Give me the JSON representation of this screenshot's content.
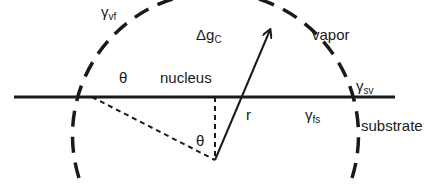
{
  "diagram": {
    "colors": {
      "stroke": "#1a1a1a",
      "background": "#ffffff"
    },
    "regions": {
      "vapor": "vapor",
      "nucleus": "nucleus",
      "substrate": "substrate"
    },
    "labels": {
      "gamma_vf": {
        "symbol": "γ",
        "sub": "vf"
      },
      "gamma_sv": {
        "symbol": "γ",
        "sub": "sv"
      },
      "gamma_fs": {
        "symbol": "γ",
        "sub": "fs"
      },
      "delta_g": {
        "symbol": "Δg",
        "sub": "C"
      },
      "theta_contact": "θ",
      "theta_center": "θ",
      "radius": "r"
    },
    "geometry": {
      "center": [
        215,
        160
      ],
      "radius": 143,
      "substrate_line_y": 97,
      "substrate_line_x": [
        14,
        395
      ],
      "arrow_tip": [
        271,
        28
      ]
    }
  }
}
